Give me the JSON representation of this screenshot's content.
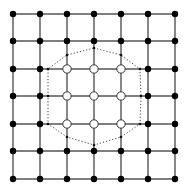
{
  "diagram": {
    "type": "lattice-grid",
    "grid": {
      "cols": 7,
      "rows": 7,
      "x": [
        13,
        40,
        67,
        94,
        121,
        148,
        175
      ],
      "y": [
        14,
        41,
        69,
        96,
        124,
        151,
        179
      ],
      "line_color": "#555555",
      "line_width": 1.4
    },
    "nodes": {
      "filled_color": "#000000",
      "filled_radius": 3.2,
      "open_fill": "#ffffff",
      "open_stroke": "#333333",
      "open_radius": 4.2,
      "open_indices": [
        [
          2,
          2
        ],
        [
          3,
          2
        ],
        [
          4,
          2
        ],
        [
          2,
          3
        ],
        [
          3,
          3
        ],
        [
          4,
          3
        ],
        [
          2,
          4
        ],
        [
          3,
          4
        ],
        [
          4,
          4
        ]
      ]
    },
    "boundary": {
      "style": "dotted",
      "color": "#444444",
      "vertex_dot_radius": 1.3,
      "vertices": [
        [
          94,
          48
        ],
        [
          121,
          55
        ],
        [
          140,
          69
        ],
        [
          141,
          96
        ],
        [
          140,
          124
        ],
        [
          121,
          137
        ],
        [
          94,
          145
        ],
        [
          67,
          137
        ],
        [
          48,
          124
        ],
        [
          48,
          96
        ],
        [
          48,
          69
        ],
        [
          67,
          55
        ]
      ]
    }
  }
}
